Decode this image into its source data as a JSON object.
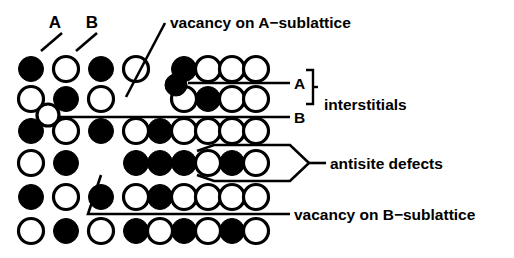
{
  "figure": {
    "colors": {
      "a_atom_fill": "#000000",
      "b_atom_fill": "#ffffff",
      "outline": "#000000",
      "background": "#ffffff"
    },
    "legend_keys": {
      "a_label": "A",
      "b_label": "B"
    },
    "annotations": [
      {
        "id": "vacancy-a",
        "text": "vacancy on A−sublattice"
      },
      {
        "id": "interstitial-a",
        "text": "A"
      },
      {
        "id": "interstitial-b",
        "text": "B"
      },
      {
        "id": "interstitials",
        "text": "interstitials"
      },
      {
        "id": "antisite",
        "text": "antisite defects"
      },
      {
        "id": "vacancy-b",
        "text": "vacancy on B−sublattice"
      }
    ]
  },
  "chart_data": {
    "type": "scatter",
    "xlabel": "",
    "ylabel": "",
    "grid": false,
    "legend_position": "inline-callouts",
    "marker_types": {
      "filled": "A atom (filled circle)",
      "open": "B atom (open circle)",
      "empty": "vacancy (no atom)"
    },
    "lattice_rows": [
      {
        "row": 1,
        "y": 69,
        "sites": [
          "filled",
          "open",
          "filled",
          "open",
          "empty",
          "filled",
          "open",
          "open",
          "open"
        ]
      },
      {
        "row": 2,
        "y": 99,
        "sites": [
          "open",
          "filled",
          "open",
          "empty",
          "empty",
          "open",
          "filled",
          "open",
          "open"
        ]
      },
      {
        "row": 3,
        "y": 131,
        "sites": [
          "filled",
          "open",
          "filled",
          "open",
          "filled",
          "open",
          "open",
          "open",
          "open"
        ]
      },
      {
        "row": 4,
        "y": 163,
        "sites": [
          "open",
          "filled",
          "empty",
          "filled",
          "filled",
          "filled",
          "open",
          "filled",
          "open"
        ]
      },
      {
        "row": 5,
        "y": 197,
        "sites": [
          "filled",
          "open",
          "filled",
          "open",
          "filled",
          "open",
          "open",
          "open",
          "open"
        ]
      },
      {
        "row": 6,
        "y": 231,
        "sites": [
          "open",
          "filled",
          "open",
          "filled",
          "open",
          "filled",
          "open",
          "filled",
          "open"
        ]
      }
    ],
    "column_x": [
      31,
      66,
      101,
      136,
      160,
      184,
      208,
      232,
      256
    ],
    "interstitials": [
      {
        "id": "interstitial-a",
        "type": "filled",
        "x": 176,
        "y": 85,
        "r": 11
      },
      {
        "id": "interstitial-b",
        "type": "open",
        "x": 48,
        "y": 115,
        "r": 11
      }
    ],
    "vacancies": [
      {
        "id": "vacancy-a",
        "sublattice": "A",
        "row": 2,
        "column_index": 3
      },
      {
        "id": "vacancy-b",
        "sublattice": "B",
        "row": 4,
        "column_index": 2
      }
    ],
    "antisite_defects": [
      {
        "row": 4,
        "column_index": 4,
        "note": "A atom on B site"
      },
      {
        "row": 4,
        "column_index": 7,
        "note": "A atom on B site"
      }
    ]
  }
}
